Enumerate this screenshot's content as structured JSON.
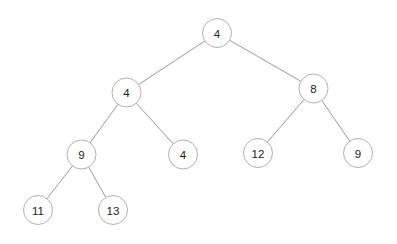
{
  "diagram": {
    "type": "binary-tree",
    "title": "",
    "canvas": {
      "width": 397,
      "height": 244,
      "background": "#ffffff"
    },
    "style": {
      "node_stroke": "#a6a6a6",
      "node_fill": "#ffffff",
      "edge_stroke": "#8c8c8c",
      "label_color": "#1a1a1a",
      "node_radius": 14.5
    },
    "nodes": [
      {
        "id": "n0",
        "label": "4",
        "x": 217,
        "y": 33,
        "level": 0
      },
      {
        "id": "n1",
        "label": "4",
        "x": 126.5,
        "y": 92.5,
        "level": 1
      },
      {
        "id": "n2",
        "label": "8",
        "x": 313.5,
        "y": 88.5,
        "level": 1
      },
      {
        "id": "n3",
        "label": "9",
        "x": 81.5,
        "y": 154.5,
        "level": 2
      },
      {
        "id": "n4",
        "label": "4",
        "x": 183,
        "y": 154.5,
        "level": 2
      },
      {
        "id": "n5",
        "label": "12",
        "x": 258,
        "y": 153,
        "level": 2
      },
      {
        "id": "n6",
        "label": "9",
        "x": 358,
        "y": 153,
        "level": 2
      },
      {
        "id": "n7",
        "label": "11",
        "x": 38,
        "y": 210,
        "level": 3
      },
      {
        "id": "n8",
        "label": "13",
        "x": 113,
        "y": 210,
        "level": 3
      }
    ],
    "edges": [
      {
        "from": "n0",
        "to": "n1",
        "side": "left"
      },
      {
        "from": "n0",
        "to": "n2",
        "side": "right"
      },
      {
        "from": "n1",
        "to": "n3",
        "side": "left"
      },
      {
        "from": "n1",
        "to": "n4",
        "side": "right"
      },
      {
        "from": "n2",
        "to": "n5",
        "side": "left"
      },
      {
        "from": "n2",
        "to": "n6",
        "side": "right"
      },
      {
        "from": "n3",
        "to": "n7",
        "side": "left"
      },
      {
        "from": "n3",
        "to": "n8",
        "side": "right"
      }
    ]
  }
}
